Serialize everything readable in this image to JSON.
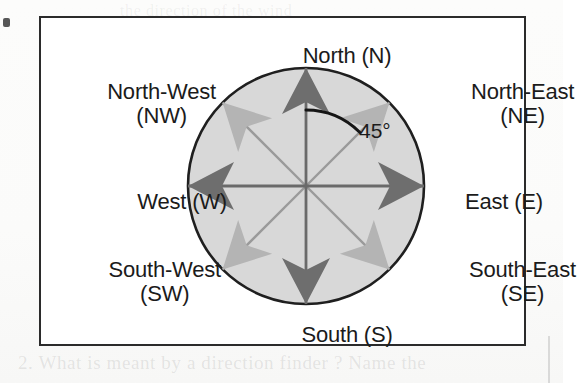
{
  "figure": {
    "type": "compass-rose-diagram",
    "frame": {
      "border_color": "#2b2b2b",
      "background": "#ffffff"
    }
  },
  "compass": {
    "disc": {
      "fill_color": "#d8d8d8",
      "outline_color": "#1f1f1f",
      "center_x": 306,
      "center_y": 186,
      "radius": 118
    },
    "cardinal_arrow_color": "#6e6e6e",
    "ordinal_arrow_color": "#b4b4b4",
    "axis_line_color": "#6e6e6e",
    "directions": [
      {
        "key": "N",
        "label_line1": "North (N)",
        "label_line2": "",
        "abbr": "N",
        "bearing_deg": 0,
        "kind": "cardinal"
      },
      {
        "key": "NE",
        "label_line1": "North-East",
        "label_line2": "(NE)",
        "abbr": "NE",
        "bearing_deg": 45,
        "kind": "ordinal"
      },
      {
        "key": "E",
        "label_line1": "East (E)",
        "label_line2": "",
        "abbr": "E",
        "bearing_deg": 90,
        "kind": "cardinal"
      },
      {
        "key": "SE",
        "label_line1": "South-East",
        "label_line2": "(SE)",
        "abbr": "SE",
        "bearing_deg": 135,
        "kind": "ordinal"
      },
      {
        "key": "S",
        "label_line1": "South (S)",
        "label_line2": "",
        "abbr": "S",
        "bearing_deg": 180,
        "kind": "cardinal"
      },
      {
        "key": "SW",
        "label_line1": "South-West",
        "label_line2": "(SW)",
        "abbr": "SW",
        "bearing_deg": 225,
        "kind": "ordinal"
      },
      {
        "key": "W",
        "label_line1": "West (W)",
        "label_line2": "",
        "abbr": "W",
        "bearing_deg": 270,
        "kind": "cardinal"
      },
      {
        "key": "NW",
        "label_line1": "North-West",
        "label_line2": "(NW)",
        "abbr": "NW",
        "bearing_deg": 315,
        "kind": "ordinal"
      }
    ],
    "angle_annotation": {
      "text": "45°",
      "from_direction": "N",
      "to_direction": "NE",
      "arc_color": "#151515"
    }
  },
  "scan_artifacts": {
    "bleed_text_bottom": "2.  What  is  meant  by  a  direction  finder ?  Name  the",
    "bleed_text_top": "the  direction  of  the  wind"
  }
}
